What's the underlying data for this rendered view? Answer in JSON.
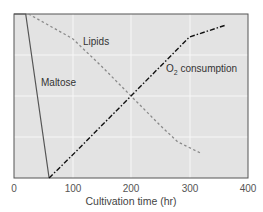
{
  "chart_data": {
    "type": "line",
    "title": "",
    "xlabel": "Cultivation time (hr)",
    "ylabel": "",
    "xlim": [
      0,
      400
    ],
    "ylim": [
      0,
      1
    ],
    "x_ticks": [
      0,
      100,
      200,
      300,
      400
    ],
    "x_tick_labels": [
      "0",
      "100",
      "200",
      "300",
      "400"
    ],
    "y_ticks": [],
    "grid": true,
    "legend_position": "inline labels",
    "series": [
      {
        "name": "Maltose",
        "style": "solid",
        "color": "#555555",
        "x": [
          0,
          20,
          60
        ],
        "values": [
          1.0,
          1.0,
          0.0
        ]
      },
      {
        "name": "Lipids",
        "style": "dotted",
        "color": "#8a8a8a",
        "x": [
          25,
          100,
          150,
          200,
          250,
          280,
          320
        ],
        "values": [
          1.0,
          0.85,
          0.68,
          0.5,
          0.32,
          0.22,
          0.15
        ]
      },
      {
        "name": "O2 consumption",
        "style": "dash-dot",
        "color": "#111111",
        "x": [
          60,
          100,
          200,
          300,
          360
        ],
        "values": [
          0.0,
          0.14,
          0.5,
          0.86,
          0.93
        ]
      }
    ],
    "annotations": [
      {
        "text": "Maltose",
        "x": 45,
        "y": 0.62
      },
      {
        "text": "Lipids",
        "x": 120,
        "y": 0.85
      },
      {
        "text": "O2 consumption",
        "x": 262,
        "y": 0.64
      }
    ]
  },
  "labels": {
    "maltose": "Maltose",
    "lipids": "Lipids",
    "o2_prefix": "O",
    "o2_sub": "2",
    "o2_suffix": " consumption",
    "xlabel": "Cultivation time (hr)",
    "ticks": [
      "0",
      "100",
      "200",
      "300",
      "400"
    ]
  },
  "colors": {
    "plot_bg": "#e3e3e3",
    "grid": "#f7f7f7",
    "frame": "#555555"
  }
}
